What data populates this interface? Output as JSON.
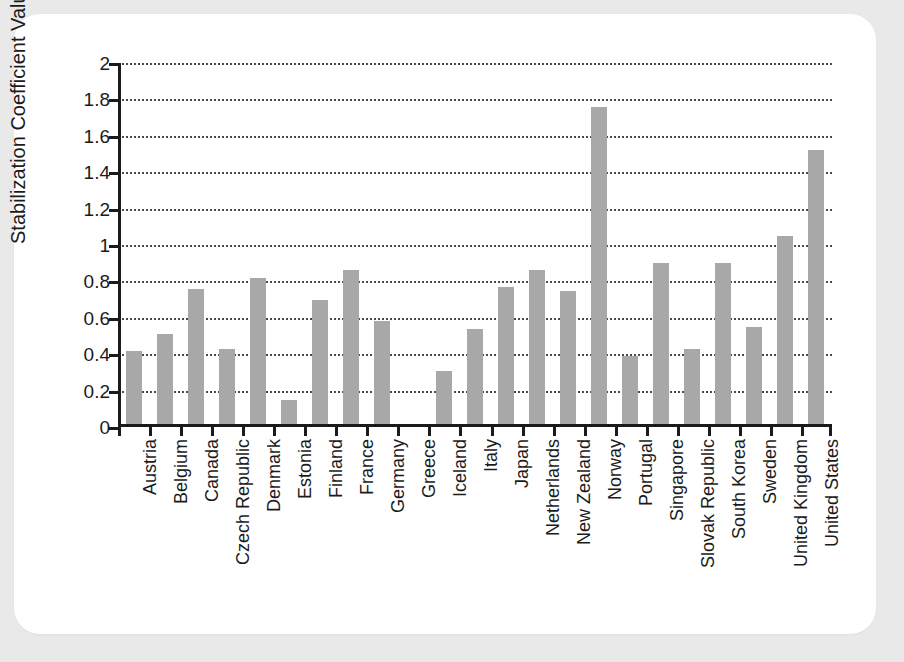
{
  "chart_data": {
    "type": "bar",
    "title": "",
    "subtitle": "",
    "xlabel": "",
    "ylabel": "Stabilization Coefficient Value",
    "ylim": [
      0,
      2
    ],
    "ytick_labels": [
      "0",
      "0.2",
      "0.4",
      "0.6",
      "0.8",
      "1",
      "1.2",
      "1.4",
      "1.6",
      "1.8",
      "2"
    ],
    "ytick_values": [
      0,
      0.2,
      0.4,
      0.6,
      0.8,
      1,
      1.2,
      1.4,
      1.6,
      1.8,
      2
    ],
    "grid": "horizontal-dotted",
    "legend": "none",
    "bar_color": "#a8a8a8",
    "axis_color": "#1b1b1b",
    "background_color": "#ffffff",
    "page_background_color": "#e9e9e9",
    "categories": [
      "Austria",
      "Belgium",
      "Canada",
      "Czech Republic",
      "Denmark",
      "Estonia",
      "Finland",
      "France",
      "Germany",
      "Greece",
      "Iceland",
      "Italy",
      "Japan",
      "Netherlands",
      "New Zealand",
      "Norway",
      "Portugal",
      "Singapore",
      "Slovak Republic",
      "South Korea",
      "Sweden",
      "United Kingdom",
      "United States"
    ],
    "values": [
      0.42,
      0.51,
      0.76,
      0.43,
      0.82,
      0.15,
      0.7,
      0.86,
      0.58,
      0.01,
      0.31,
      0.54,
      0.77,
      0.86,
      0.75,
      1.76,
      0.39,
      0.9,
      0.43,
      0.9,
      0.55,
      1.05,
      1.52
    ]
  }
}
